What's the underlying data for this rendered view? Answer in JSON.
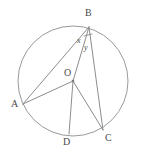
{
  "figure": {
    "type": "geometry-diagram",
    "canvas": {
      "width": 144,
      "height": 160
    },
    "colors": {
      "background": "#ffffff",
      "circle_stroke": "#9a9a9a",
      "segment_stroke": "#8d8d8d",
      "label_text": "#4a4a4a"
    },
    "circle": {
      "cx": 73,
      "cy": 81,
      "r": 55
    },
    "points": [
      {
        "id": "A",
        "label": "A",
        "x": 23,
        "y": 104,
        "label_x": 11,
        "label_y": 99,
        "on_circle": true
      },
      {
        "id": "B",
        "label": "B",
        "x": 89,
        "y": 27,
        "label_x": 85,
        "label_y": 8,
        "on_circle": true
      },
      {
        "id": "C",
        "label": "C",
        "x": 103,
        "y": 130,
        "label_x": 105,
        "label_y": 133,
        "on_circle": true
      },
      {
        "id": "D",
        "label": "D",
        "x": 69,
        "y": 134,
        "label_x": 63,
        "label_y": 137,
        "on_circle": true
      },
      {
        "id": "O",
        "label": "O",
        "x": 73,
        "y": 81,
        "label_x": 64,
        "label_y": 68,
        "on_circle": false
      }
    ],
    "segments": [
      {
        "id": "BA",
        "from": "B",
        "to": "A",
        "kind": "chord"
      },
      {
        "id": "BO",
        "from": "B",
        "to": "O",
        "kind": "radius"
      },
      {
        "id": "BC",
        "from": "B",
        "to": "C",
        "kind": "chord"
      },
      {
        "id": "OA",
        "from": "O",
        "to": "A",
        "kind": "radius"
      },
      {
        "id": "OD",
        "from": "O",
        "to": "D",
        "kind": "radius"
      },
      {
        "id": "OC",
        "from": "O",
        "to": "C",
        "kind": "radius"
      }
    ],
    "angles": [
      {
        "id": "x",
        "label": "x",
        "vertex": "B",
        "between": [
          "BA",
          "BO"
        ],
        "label_x": 77,
        "label_y": 37
      },
      {
        "id": "y",
        "label": "y",
        "vertex": "B",
        "between": [
          "BO",
          "BC"
        ],
        "label_x": 84,
        "label_y": 44
      }
    ],
    "markers": [
      {
        "id": "angle-tick-at-B",
        "x1": 84,
        "y1": 36,
        "x2": 92,
        "y2": 34
      }
    ]
  }
}
